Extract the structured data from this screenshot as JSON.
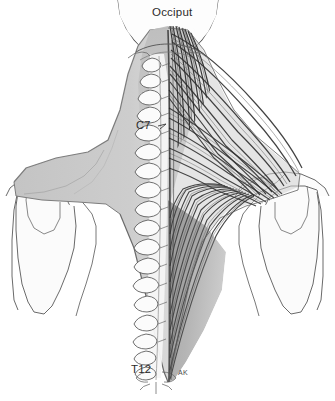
{
  "figure": {
    "background_color": "#ffffff",
    "width": 335,
    "height": 401,
    "labels": {
      "occiput": "Occiput",
      "c7": "C7",
      "t12": "T12",
      "signature": "AK"
    },
    "colors": {
      "outline": "#4a4a4a",
      "bone_fill": "#fbfbfb",
      "muscle_silhouette": "#c9c9c9",
      "muscle_silhouette_dark": "#b4b4b4",
      "muscle_fiber_dark": "#2e2e2e",
      "muscle_fiber_mid": "#6d6d6d",
      "vertebra_fill": "#f2f2f2",
      "label_text": "#2b2b2b"
    },
    "anatomy": {
      "left_side": "flat gray silhouette of trapezius",
      "right_side": "detailed dark muscle fibers radiating from spine",
      "spine": "vertebral column with spinous processes from occiput to T12",
      "shoulders": "scapula, clavicle and humerus outlines both sides"
    }
  }
}
